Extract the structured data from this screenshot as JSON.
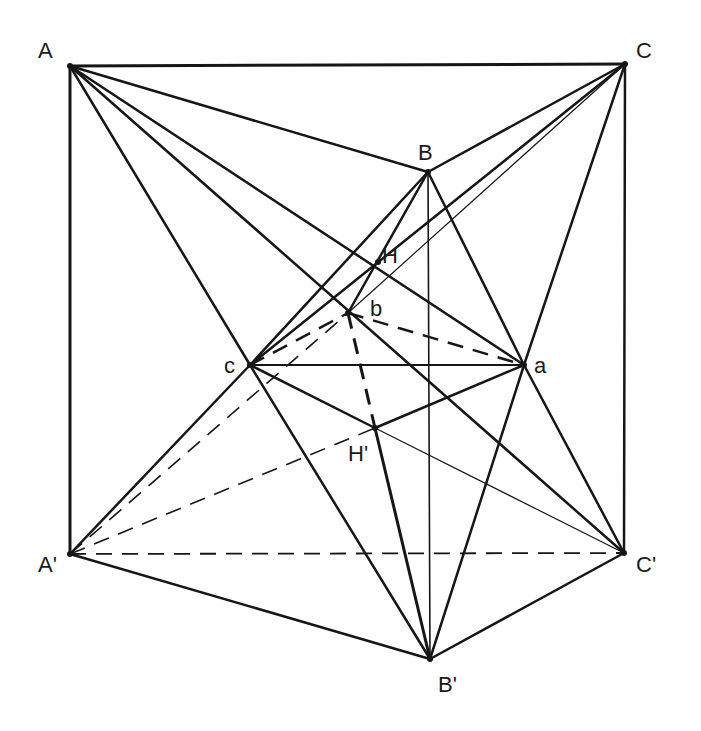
{
  "diagram": {
    "type": "geometric-construction",
    "ink_color": "#161616",
    "background": "#ffffff",
    "points": {
      "A": {
        "label": "A",
        "x": 70,
        "y": 66,
        "lx": 38,
        "ly": 58
      },
      "C": {
        "label": "C",
        "x": 625,
        "y": 64,
        "lx": 636,
        "ly": 58
      },
      "B": {
        "label": "B",
        "x": 428,
        "y": 172,
        "lx": 418,
        "ly": 160
      },
      "H": {
        "label": "H",
        "x": 378,
        "y": 262,
        "lx": 382,
        "ly": 263
      },
      "b": {
        "label": "b",
        "x": 348,
        "y": 313,
        "lx": 370,
        "ly": 316
      },
      "c": {
        "label": "c",
        "x": 250,
        "y": 365,
        "lx": 224,
        "ly": 373
      },
      "a": {
        "label": "a",
        "x": 524,
        "y": 365,
        "lx": 534,
        "ly": 373
      },
      "Hp": {
        "label": "H'",
        "x": 375,
        "y": 428,
        "lx": 348,
        "ly": 461
      },
      "Ap": {
        "label": "A'",
        "x": 70,
        "y": 554,
        "lx": 38,
        "ly": 572
      },
      "Cp": {
        "label": "C'",
        "x": 624,
        "y": 553,
        "lx": 636,
        "ly": 572
      },
      "Bp": {
        "label": "B'",
        "x": 430,
        "y": 659,
        "lx": 438,
        "ly": 692
      }
    },
    "edges": [
      {
        "from": "A",
        "to": "C",
        "style": "solid",
        "w": 3
      },
      {
        "from": "A",
        "to": "Ap",
        "style": "solid",
        "w": 3
      },
      {
        "from": "C",
        "to": "Cp",
        "style": "solid",
        "w": 2.5
      },
      {
        "from": "A",
        "to": "B",
        "style": "solid",
        "w": 2.5
      },
      {
        "from": "A",
        "to": "a",
        "style": "solid",
        "w": 2.5
      },
      {
        "from": "A",
        "to": "Cp",
        "style": "solid",
        "w": 2.5
      },
      {
        "from": "A",
        "to": "c",
        "style": "solid",
        "w": 2.5
      },
      {
        "from": "C",
        "to": "B",
        "style": "solid",
        "w": 2.5
      },
      {
        "from": "C",
        "to": "c",
        "style": "solid",
        "w": 2.5
      },
      {
        "from": "C",
        "to": "b",
        "style": "solid",
        "w": 1.2
      },
      {
        "from": "C",
        "to": "a",
        "style": "solid",
        "w": 2.5
      },
      {
        "from": "B",
        "to": "c",
        "style": "solid",
        "w": 2.5
      },
      {
        "from": "B",
        "to": "b",
        "style": "solid",
        "w": 2.5
      },
      {
        "from": "B",
        "to": "a",
        "style": "solid",
        "w": 2.5
      },
      {
        "from": "B",
        "to": "Bp",
        "style": "solid",
        "w": 1.6
      },
      {
        "from": "c",
        "to": "a",
        "style": "solid",
        "w": 2
      },
      {
        "from": "c",
        "to": "Hp",
        "style": "solid",
        "w": 2.5
      },
      {
        "from": "c",
        "to": "Bp",
        "style": "solid",
        "w": 2.5
      },
      {
        "from": "Ap",
        "to": "c",
        "style": "solid",
        "w": 2.5
      },
      {
        "from": "a",
        "to": "Hp",
        "style": "solid",
        "w": 2.5
      },
      {
        "from": "a",
        "to": "Cp",
        "style": "solid",
        "w": 2.5
      },
      {
        "from": "a",
        "to": "Bp",
        "style": "solid",
        "w": 2.5
      },
      {
        "from": "Ap",
        "to": "Bp",
        "style": "solid",
        "w": 2.5
      },
      {
        "from": "Bp",
        "to": "Cp",
        "style": "solid",
        "w": 2.5
      },
      {
        "from": "Hp",
        "to": "Bp",
        "style": "solid",
        "w": 3
      },
      {
        "from": "Hp",
        "to": "Cp",
        "style": "solid",
        "w": 1.2
      },
      {
        "from": "c",
        "to": "b",
        "style": "dashed",
        "w": 2.5
      },
      {
        "from": "b",
        "to": "a",
        "style": "dashed",
        "w": 2.5
      },
      {
        "from": "b",
        "to": "Hp",
        "style": "dashed",
        "w": 3
      },
      {
        "from": "Ap",
        "to": "b",
        "style": "dashed",
        "w": 1.6
      },
      {
        "from": "Ap",
        "to": "Hp",
        "style": "dashed",
        "w": 1.6
      },
      {
        "from": "Ap",
        "to": "Cp",
        "style": "dashed",
        "w": 1.8
      }
    ]
  }
}
